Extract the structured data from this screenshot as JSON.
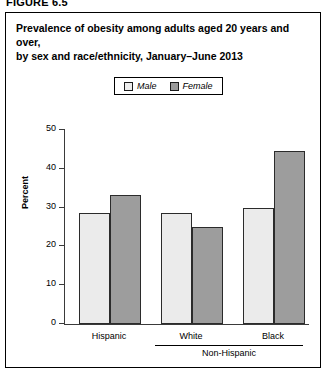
{
  "figure_label": "FIGURE 6.5",
  "title": {
    "line1": "Prevalence of obesity among adults aged 20 years and over,",
    "line2": "by sex and race/ethnicity, January–June 2013"
  },
  "legend": {
    "male": "Male",
    "female": "Female"
  },
  "axis": {
    "y_title": "Percent",
    "y_ticks": [
      "50",
      "40",
      "30",
      "20",
      "10",
      "0"
    ],
    "group_label": "Non-Hispanic"
  },
  "colors": {
    "male_fill": "#ebebeb",
    "female_fill": "#9d9d9d",
    "outline": "#2b2b2b",
    "axis": "#3a3a3a"
  },
  "chart_data": {
    "type": "bar",
    "title": "Prevalence of obesity among adults aged 20 years and over, by sex and race/ethnicity, January–June 2013",
    "xlabel": "",
    "ylabel": "Percent",
    "ylim": [
      0,
      50
    ],
    "yticks": [
      0,
      10,
      20,
      30,
      40,
      50
    ],
    "grid": false,
    "legend_position": "top-center",
    "categories": [
      "Hispanic",
      "White",
      "Black"
    ],
    "category_group": {
      "label": "Non-Hispanic",
      "members": [
        "White",
        "Black"
      ]
    },
    "series": [
      {
        "name": "Male",
        "values": [
          28.5,
          28.5,
          30.0
        ]
      },
      {
        "name": "Female",
        "values": [
          33.2,
          25.0,
          44.5
        ]
      }
    ]
  }
}
